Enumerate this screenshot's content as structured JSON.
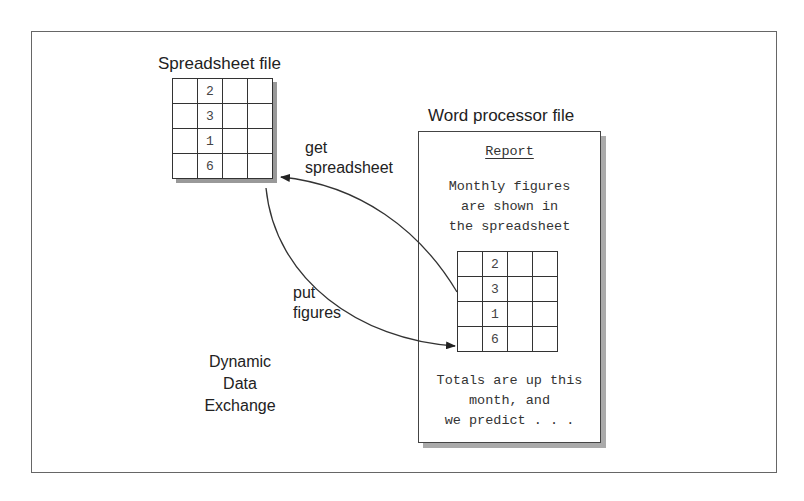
{
  "diagram": {
    "spreadsheet": {
      "title": "Spreadsheet file",
      "rows": [
        [
          "",
          "2",
          "",
          ""
        ],
        [
          "",
          "3",
          "",
          ""
        ],
        [
          "",
          "1",
          "",
          ""
        ],
        [
          "",
          "6",
          "",
          ""
        ]
      ]
    },
    "word_processor": {
      "title": "Word processor file",
      "heading": "Report",
      "intro_lines": [
        "Monthly figures",
        "are shown in",
        "the spreadsheet"
      ],
      "embedded_rows": [
        [
          "",
          "2",
          "",
          ""
        ],
        [
          "",
          "3",
          "",
          ""
        ],
        [
          "",
          "1",
          "",
          ""
        ],
        [
          "",
          "6",
          "",
          ""
        ]
      ],
      "outro_lines": [
        "Totals are up this",
        "month, and",
        "we predict . . ."
      ]
    },
    "arrows": {
      "get": {
        "line1": "get",
        "line2": "spreadsheet"
      },
      "put": {
        "line1": "put",
        "line2": "figures"
      }
    },
    "caption": {
      "line1": "Dynamic",
      "line2": "Data",
      "line3": "Exchange"
    }
  }
}
